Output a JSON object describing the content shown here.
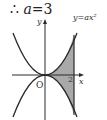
{
  "equation": {
    "therefore": "∴",
    "variable": "a",
    "equals": "=3"
  },
  "diagram": {
    "y_axis_label": "y",
    "x_axis_label": "x",
    "origin_label": "O",
    "x_tick_label": "2",
    "curve_label": "y=ax²",
    "colors": {
      "line": "#2a2a2a",
      "shade": "#a9a9a9"
    }
  }
}
